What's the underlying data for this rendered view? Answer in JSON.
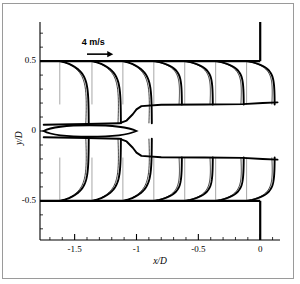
{
  "figure": {
    "background_color": "#ffffff",
    "frame_color": "#9a9a9a",
    "line_color": "#000000",
    "station_line_color": "#9e9e9e"
  },
  "chart_data": {
    "type": "line",
    "title": "",
    "subtitle": "",
    "xlabel": "x/D",
    "ylabel": "y/D",
    "xlim": [
      -1.78,
      0.16
    ],
    "ylim": [
      -0.78,
      0.78
    ],
    "grid": false,
    "legend_position": "none",
    "x_major_ticks": [
      -1.5,
      -1,
      -0.5,
      0
    ],
    "x_major_tick_labels": [
      "-1.5",
      "-1",
      "-0.5",
      "0"
    ],
    "x_minor_tick_step": 0.1,
    "y_major_ticks": [
      0.5,
      0,
      -0.5
    ],
    "y_major_tick_labels": [
      "0.5",
      "0",
      "-0.5"
    ],
    "y_minor_tick_step": 0.1,
    "annotations": [
      {
        "name": "velocity-scale",
        "text": "4 m/s",
        "x": -1.35,
        "y": 0.62,
        "arrow_from_x": -1.4,
        "arrow_to_x": -1.2,
        "arrow_y": 0.55
      }
    ],
    "walls": [
      {
        "name": "upper-wall",
        "x_from": -1.78,
        "x_to": 0.0,
        "y": 0.5
      },
      {
        "name": "lower-wall",
        "x_from": -1.78,
        "x_to": 0.0,
        "y": -0.5
      },
      {
        "name": "exit-wall-upper",
        "x": 0.0,
        "y_from": 0.5,
        "y_to": 0.78
      },
      {
        "name": "exit-wall-lower",
        "x": 0.0,
        "y_from": -0.5,
        "y_to": -0.78
      }
    ],
    "profile_stations_x": [
      -1.62,
      -1.36,
      -1.11,
      -0.86,
      -0.61,
      -0.36,
      -0.11
    ],
    "series": [
      {
        "name": "measured-velocity-profile",
        "style": "thick-solid",
        "description": "Streamwise velocity profiles U(y) drawn as horizontal displacement from each station line"
      },
      {
        "name": "computed-velocity-profile",
        "style": "thin-solid",
        "description": "Companion profile overlay at each station"
      },
      {
        "name": "shear-layer-boundary",
        "style": "thick-solid",
        "description": "Jet shear-layer / recirculation boundary traced through the domain"
      }
    ],
    "centerline_feature": {
      "name": "centerline-bubble",
      "x_from": -1.75,
      "x_to": -1.0,
      "y": 0.0,
      "description": "Lens-shaped closed contour on the symmetry axis near the inlet"
    },
    "shear_layer_upper_y_downstream": 0.19,
    "shear_layer_lower_y_downstream": -0.19
  },
  "axis_titles": {
    "x": "x/D",
    "y": "y/D"
  }
}
